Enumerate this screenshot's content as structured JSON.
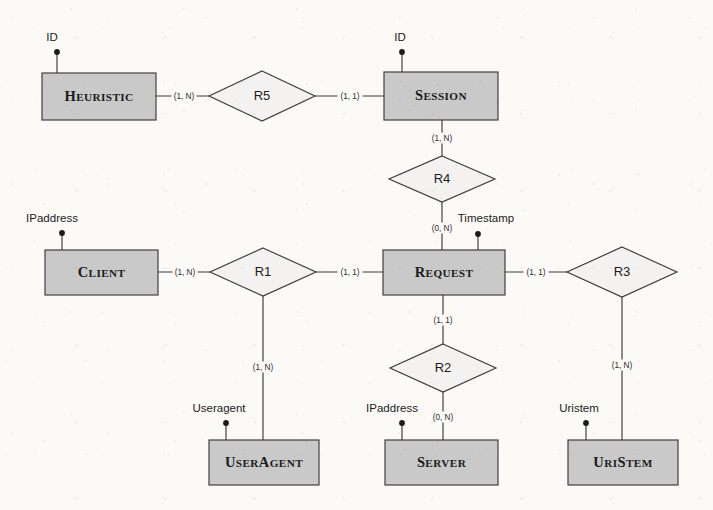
{
  "diagram": {
    "type": "entity-relationship-diagram",
    "notation": "min-max cardinality",
    "colors": {
      "entity_fill": "#c9c9c9",
      "relationship_fill": "#f3f2f0",
      "stroke": "#3a3a3a",
      "background": "#fbfaf7",
      "text": "#1b1b1b"
    },
    "entities": [
      {
        "id": "heuristic",
        "name": "Heuristic",
        "x": 42,
        "y": 73,
        "w": 114,
        "h": 47
      },
      {
        "id": "session",
        "name": "Session",
        "x": 384,
        "y": 72,
        "w": 114,
        "h": 48
      },
      {
        "id": "client",
        "name": "Client",
        "x": 45,
        "y": 250,
        "w": 113,
        "h": 45
      },
      {
        "id": "request",
        "name": "Request",
        "x": 383,
        "y": 250,
        "w": 122,
        "h": 45
      },
      {
        "id": "useragent",
        "name": "UserAgent",
        "x": 209,
        "y": 440,
        "w": 110,
        "h": 45
      },
      {
        "id": "server",
        "name": "Server",
        "x": 385,
        "y": 440,
        "w": 113,
        "h": 45
      },
      {
        "id": "uristem",
        "name": "UriStem",
        "x": 568,
        "y": 440,
        "w": 110,
        "h": 45
      }
    ],
    "relationships": [
      {
        "id": "r5",
        "name": "R5",
        "cx": 262,
        "cy": 96,
        "rx": 53,
        "ry": 25
      },
      {
        "id": "r4",
        "name": "R4",
        "cx": 442,
        "cy": 179,
        "rx": 53,
        "ry": 23
      },
      {
        "id": "r1",
        "name": "R1",
        "cx": 263,
        "cy": 272,
        "rx": 53,
        "ry": 24
      },
      {
        "id": "r3",
        "name": "R3",
        "cx": 622,
        "cy": 272,
        "rx": 55,
        "ry": 25
      },
      {
        "id": "r2",
        "name": "R2",
        "cx": 443,
        "cy": 368,
        "rx": 53,
        "ry": 24
      }
    ],
    "attributes": [
      {
        "id": "heuristic-id",
        "label": "ID",
        "label_x": 52,
        "label_y": 38,
        "dot_x": 57,
        "dot_y": 52,
        "stem_to_x": 57,
        "stem_to_y": 73
      },
      {
        "id": "session-id",
        "label": "ID",
        "label_x": 400,
        "label_y": 38,
        "dot_x": 402,
        "dot_y": 52,
        "stem_to_x": 402,
        "stem_to_y": 72
      },
      {
        "id": "client-ipaddress",
        "label": "IPaddress",
        "label_x": 52,
        "label_y": 219,
        "dot_x": 62,
        "dot_y": 233,
        "stem_to_x": 62,
        "stem_to_y": 250
      },
      {
        "id": "request-timestamp",
        "label": "Timestamp",
        "label_x": 486,
        "label_y": 219,
        "dot_x": 478,
        "dot_y": 234,
        "stem_to_x": 478,
        "stem_to_y": 250
      },
      {
        "id": "useragent-useragent",
        "label": "Useragent",
        "label_x": 219,
        "label_y": 409,
        "dot_x": 226,
        "dot_y": 423,
        "stem_to_x": 226,
        "stem_to_y": 440
      },
      {
        "id": "server-ipaddress",
        "label": "IPaddress",
        "label_x": 392,
        "label_y": 409,
        "dot_x": 402,
        "dot_y": 423,
        "stem_to_x": 402,
        "stem_to_y": 440
      },
      {
        "id": "uristem-uristem",
        "label": "Uristem",
        "label_x": 579,
        "label_y": 409,
        "dot_x": 586,
        "dot_y": 423,
        "stem_to_x": 586,
        "stem_to_y": 440
      }
    ],
    "connections": [
      {
        "id": "heuristic-r5",
        "from": "heuristic",
        "to": "r5",
        "x1": 156,
        "y1": 96,
        "x2": 209,
        "y2": 96,
        "cardinality": "(1, N)",
        "label_x": 184,
        "label_y": 96
      },
      {
        "id": "r5-session",
        "from": "r5",
        "to": "session",
        "x1": 315,
        "y1": 96,
        "x2": 384,
        "y2": 96,
        "cardinality": "(1, 1)",
        "label_x": 350,
        "label_y": 96
      },
      {
        "id": "session-r4",
        "from": "session",
        "to": "r4",
        "x1": 442,
        "y1": 120,
        "x2": 442,
        "y2": 156,
        "cardinality": "(1, N)",
        "label_x": 442,
        "label_y": 138
      },
      {
        "id": "r4-request",
        "from": "r4",
        "to": "request",
        "x1": 442,
        "y1": 202,
        "x2": 442,
        "y2": 250,
        "cardinality": "(0, N)",
        "label_x": 442,
        "label_y": 228
      },
      {
        "id": "client-r1",
        "from": "client",
        "to": "r1",
        "x1": 158,
        "y1": 272,
        "x2": 210,
        "y2": 272,
        "cardinality": "(1, N)",
        "label_x": 185,
        "label_y": 272
      },
      {
        "id": "r1-request",
        "from": "r1",
        "to": "request",
        "x1": 316,
        "y1": 272,
        "x2": 383,
        "y2": 272,
        "cardinality": "(1, 1)",
        "label_x": 350,
        "label_y": 272
      },
      {
        "id": "r1-useragent",
        "from": "r1",
        "to": "useragent",
        "x1": 263,
        "y1": 296,
        "x2": 263,
        "y2": 440,
        "cardinality": "(1, N)",
        "label_x": 263,
        "label_y": 367
      },
      {
        "id": "request-r2",
        "from": "request",
        "to": "r2",
        "x1": 443,
        "y1": 295,
        "x2": 443,
        "y2": 344,
        "cardinality": "(1, 1)",
        "label_x": 443,
        "label_y": 320
      },
      {
        "id": "r2-server",
        "from": "r2",
        "to": "server",
        "x1": 443,
        "y1": 392,
        "x2": 443,
        "y2": 440,
        "cardinality": "(0, N)",
        "label_x": 443,
        "label_y": 417
      },
      {
        "id": "request-r3",
        "from": "request",
        "to": "r3",
        "x1": 505,
        "y1": 272,
        "x2": 567,
        "y2": 272,
        "cardinality": "(1, 1)",
        "label_x": 536,
        "label_y": 272
      },
      {
        "id": "r3-uristem",
        "from": "r3",
        "to": "uristem",
        "x1": 622,
        "y1": 297,
        "x2": 622,
        "y2": 440,
        "cardinality": "(1, N)",
        "label_x": 622,
        "label_y": 365
      }
    ]
  }
}
